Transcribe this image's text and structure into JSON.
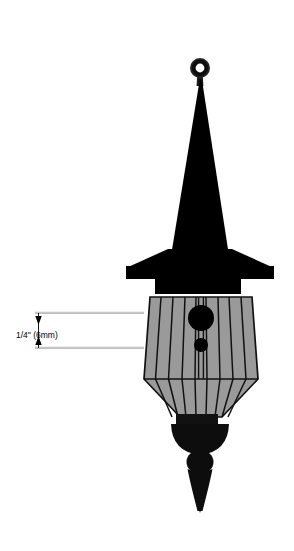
{
  "drawing": {
    "title": "Finial Spire Technical Drawing",
    "background_color": "#ffffff",
    "canvas": {
      "width": 294,
      "height": 551
    },
    "colors": {
      "ink": "#000000",
      "body_fill": "#9a9a9a",
      "body_fill_dark": "#8e8e8e",
      "outline": "#111111",
      "dimension_line": "#9c9c9c",
      "ring_stroke": "#262626"
    },
    "annotation": {
      "dimension_label": "1/4\" (6mm)",
      "value_imperial": "1/4\"",
      "value_metric": "6mm",
      "label_x": 16,
      "label_y": 338,
      "extension_line_top_y": 313,
      "extension_line_bottom_y": 348,
      "extension_line_x_start": 35,
      "extension_line_x_end": 144,
      "dimension_line_x": 38,
      "arrow_direction": "inward-double"
    },
    "parts": [
      {
        "name": "top-eyelet-ring",
        "shape": "annulus",
        "cx": 200,
        "cy": 68,
        "outer_r": 10,
        "inner_r": 4.6,
        "fill": "#262626"
      },
      {
        "name": "spire-cone",
        "shape": "tapered-triangle",
        "apex_y": 78,
        "base_y": 262,
        "top_width": 4,
        "base_width": 60
      },
      {
        "name": "spire-base-flange",
        "shape": "flared-skirt",
        "top_y": 258,
        "bottom_y": 278,
        "width": 148
      },
      {
        "name": "neck-collar",
        "shape": "rectangle",
        "x": 155,
        "y": 278,
        "width": 86,
        "height": 16
      },
      {
        "name": "lantern-body",
        "shape": "faceted-bell",
        "top_y": 297,
        "waist_y": 381,
        "bottom_y": 417,
        "top_width": 100,
        "waist_width": 122,
        "bottom_width": 44,
        "facet_count": 9
      },
      {
        "name": "lantern-vent-large",
        "shape": "circle",
        "cx": 201,
        "cy": 318,
        "r": 13
      },
      {
        "name": "lantern-vent-small",
        "shape": "circle",
        "cx": 201,
        "cy": 345,
        "r": 7
      },
      {
        "name": "lantern-foot-block",
        "shape": "rectangle",
        "x": 176,
        "y": 414,
        "width": 42,
        "height": 12
      },
      {
        "name": "bottom-finial-bowl",
        "shape": "bowl",
        "top_y": 424,
        "bottom_y": 452,
        "width": 58
      },
      {
        "name": "bottom-finial-bead",
        "shape": "sphere",
        "cx": 200,
        "cy": 462,
        "r": 13
      },
      {
        "name": "bottom-finial-spike",
        "shape": "tapered-spike",
        "top_y": 470,
        "tip_y": 512,
        "top_width": 26
      }
    ]
  }
}
